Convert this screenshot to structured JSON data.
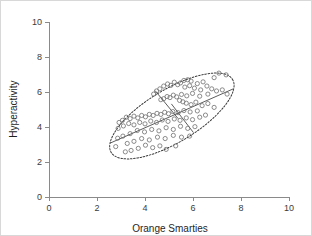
{
  "chart_data": {
    "type": "scatter",
    "title": "",
    "subtitle": "",
    "xlabel": "Orange Smarties",
    "ylabel": "Hyperactivity",
    "xlim": [
      0,
      10
    ],
    "ylim": [
      0,
      10
    ],
    "xticks": [
      0,
      2,
      4,
      6,
      8,
      10
    ],
    "yticks": [
      0,
      2,
      4,
      6,
      8,
      10
    ],
    "xtick_labels": [
      "0",
      "2",
      "4",
      "6",
      "8",
      "10"
    ],
    "ytick_labels": [
      "0",
      "2",
      "4",
      "6",
      "8",
      "10"
    ],
    "grid": false,
    "legend": null,
    "legend_position": "none",
    "point_style": {
      "marker": "open-circle",
      "radius_px": 2.1,
      "stroke_color": "#6e6e6e",
      "fill_color": "none"
    },
    "annotations": [
      {
        "name": "confidence-ellipse",
        "type": "ellipse",
        "center_x": 5.12,
        "center_y": 4.63,
        "semi_major": 2.95,
        "semi_minor": 1.35,
        "rotation_deg": 31,
        "style": "dotted",
        "stroke_color": "#3a3a3a"
      },
      {
        "name": "major-axis-line",
        "type": "line",
        "x1": 2.55,
        "y1": 3.08,
        "x2": 7.68,
        "y2": 6.18,
        "style": "solid",
        "stroke_color": "#4a4a4a"
      },
      {
        "name": "minor-chord-upper-left",
        "type": "line",
        "x1": 4.42,
        "y1": 6.08,
        "x2": 5.38,
        "y2": 4.48,
        "style": "solid",
        "stroke_color": "#4a4a4a"
      },
      {
        "name": "minor-chord-lower-right",
        "type": "line",
        "x1": 5.1,
        "y1": 5.32,
        "x2": 6.02,
        "y2": 3.68,
        "style": "solid",
        "stroke_color": "#4a4a4a"
      }
    ],
    "points": [
      [
        7.08,
        7.08
      ],
      [
        7.38,
        6.98
      ],
      [
        6.88,
        6.82
      ],
      [
        6.42,
        6.58
      ],
      [
        6.18,
        6.48
      ],
      [
        5.92,
        6.62
      ],
      [
        5.78,
        6.7
      ],
      [
        5.62,
        6.66
      ],
      [
        5.48,
        6.52
      ],
      [
        5.36,
        6.42
      ],
      [
        5.22,
        6.56
      ],
      [
        5.08,
        6.38
      ],
      [
        4.94,
        6.46
      ],
      [
        4.78,
        6.34
      ],
      [
        4.62,
        6.18
      ],
      [
        4.48,
        6.06
      ],
      [
        4.36,
        5.88
      ],
      [
        5.66,
        6.28
      ],
      [
        5.86,
        6.36
      ],
      [
        6.06,
        6.22
      ],
      [
        6.32,
        6.12
      ],
      [
        6.58,
        6.34
      ],
      [
        6.78,
        6.18
      ],
      [
        6.98,
        6.06
      ],
      [
        7.22,
        6.12
      ],
      [
        7.42,
        5.88
      ],
      [
        6.62,
        5.88
      ],
      [
        6.28,
        5.76
      ],
      [
        5.98,
        5.92
      ],
      [
        5.74,
        5.78
      ],
      [
        5.52,
        5.86
      ],
      [
        5.32,
        5.72
      ],
      [
        5.18,
        5.82
      ],
      [
        5.04,
        5.68
      ],
      [
        4.92,
        5.74
      ],
      [
        4.78,
        5.62
      ],
      [
        4.66,
        5.56
      ],
      [
        5.44,
        5.52
      ],
      [
        5.58,
        5.44
      ],
      [
        5.72,
        5.36
      ],
      [
        5.92,
        5.28
      ],
      [
        6.12,
        5.42
      ],
      [
        6.38,
        5.22
      ],
      [
        6.62,
        5.34
      ],
      [
        6.88,
        5.12
      ],
      [
        6.18,
        4.92
      ],
      [
        5.88,
        4.86
      ],
      [
        5.62,
        4.94
      ],
      [
        5.38,
        4.82
      ],
      [
        5.16,
        4.88
      ],
      [
        4.98,
        4.76
      ],
      [
        4.82,
        4.84
      ],
      [
        4.66,
        4.72
      ],
      [
        4.5,
        4.78
      ],
      [
        4.34,
        4.66
      ],
      [
        4.18,
        4.72
      ],
      [
        4.02,
        4.58
      ],
      [
        3.86,
        4.66
      ],
      [
        3.7,
        4.52
      ],
      [
        3.54,
        4.62
      ],
      [
        3.38,
        4.48
      ],
      [
        3.22,
        4.56
      ],
      [
        3.06,
        4.38
      ],
      [
        2.92,
        4.26
      ],
      [
        6.52,
        4.68
      ],
      [
        6.28,
        4.56
      ],
      [
        5.98,
        4.42
      ],
      [
        5.72,
        4.52
      ],
      [
        5.46,
        4.38
      ],
      [
        5.22,
        4.46
      ],
      [
        4.96,
        4.32
      ],
      [
        4.72,
        4.4
      ],
      [
        4.48,
        4.26
      ],
      [
        4.24,
        4.34
      ],
      [
        4.0,
        4.18
      ],
      [
        3.78,
        4.26
      ],
      [
        3.54,
        4.12
      ],
      [
        3.32,
        4.2
      ],
      [
        3.1,
        4.06
      ],
      [
        2.88,
        3.92
      ],
      [
        6.08,
        4.02
      ],
      [
        5.78,
        3.92
      ],
      [
        5.48,
        4.04
      ],
      [
        5.18,
        3.86
      ],
      [
        4.88,
        3.96
      ],
      [
        4.58,
        3.78
      ],
      [
        4.28,
        3.86
      ],
      [
        3.98,
        3.72
      ],
      [
        3.68,
        3.8
      ],
      [
        3.38,
        3.62
      ],
      [
        3.08,
        3.48
      ],
      [
        2.86,
        3.36
      ],
      [
        5.86,
        3.48
      ],
      [
        5.52,
        3.42
      ],
      [
        5.18,
        3.52
      ],
      [
        4.84,
        3.34
      ],
      [
        4.52,
        3.42
      ],
      [
        4.18,
        3.26
      ],
      [
        3.86,
        3.34
      ],
      [
        3.54,
        3.18
      ],
      [
        3.26,
        3.06
      ],
      [
        4.62,
        2.92
      ],
      [
        4.32,
        2.82
      ],
      [
        4.02,
        2.96
      ],
      [
        3.72,
        2.78
      ],
      [
        3.42,
        2.66
      ],
      [
        3.18,
        2.58
      ],
      [
        4.88,
        2.72
      ],
      [
        5.28,
        2.92
      ],
      [
        2.78,
        2.88
      ]
    ]
  }
}
